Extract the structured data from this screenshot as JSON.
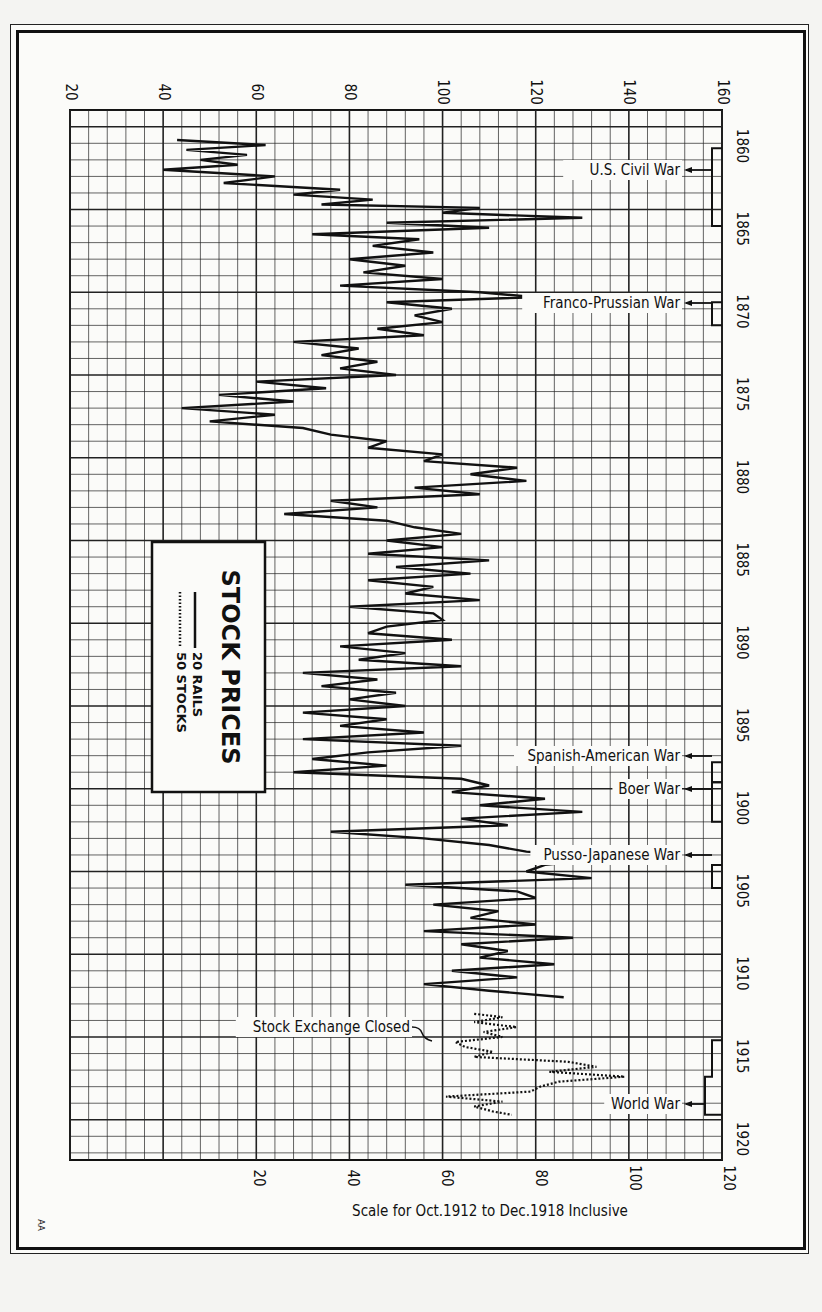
{
  "chart_data": {
    "type": "line",
    "title": "STOCK PRICES",
    "orientation": "rotated-90 (years run top-to-bottom, price runs left-to-right)",
    "legend": [
      {
        "label": "20 RAILS",
        "style": "solid"
      },
      {
        "label": "50 STOCKS",
        "style": "dotted"
      }
    ],
    "legend_position": "left-center box",
    "grid": true,
    "year_axis": {
      "ticks": [
        "1860",
        "1865",
        "1870",
        "1875",
        "1880",
        "1885",
        "1890",
        "1895",
        "1900",
        "1905",
        "1910",
        "1915",
        "1920"
      ],
      "range": [
        1860,
        1920
      ]
    },
    "price_axis_top": {
      "label": "",
      "ticks": [
        "20",
        "40",
        "60",
        "80",
        "100",
        "120",
        "140",
        "160"
      ],
      "range": [
        20,
        160
      ]
    },
    "price_axis_bottom": {
      "label": "Scale for Oct.1912 to Dec.1918 Inclusive",
      "ticks": [
        "20",
        "40",
        "60",
        "80",
        "100",
        "120"
      ],
      "range": [
        0,
        120
      ]
    },
    "annotations": [
      {
        "text": "U.S. Civil War",
        "years": [
          1861,
          1865
        ]
      },
      {
        "text": "Franco-Prussian War",
        "years": [
          1870,
          1871
        ]
      },
      {
        "text": "Spanish-American War",
        "years": [
          1898,
          1898
        ]
      },
      {
        "text": "Boer War",
        "years": [
          1899,
          1902
        ]
      },
      {
        "text": "Pusso-Japanese War",
        "years": [
          1904,
          1905
        ]
      },
      {
        "text": "Stock Exchange Closed",
        "years": [
          1914,
          1914
        ]
      },
      {
        "text": "World War",
        "years": [
          1914,
          1918
        ]
      }
    ],
    "series": [
      {
        "name": "20 RAILS",
        "style": "solid",
        "x_year": [
          1860.0,
          1860.3,
          1860.6,
          1860.9,
          1861.2,
          1861.5,
          1861.8,
          1862.2,
          1862.6,
          1863.0,
          1863.3,
          1863.6,
          1863.9,
          1864.1,
          1864.4,
          1864.7,
          1865.0,
          1865.3,
          1865.7,
          1866.0,
          1866.4,
          1866.8,
          1867.2,
          1867.6,
          1868.0,
          1868.4,
          1868.8,
          1869.2,
          1869.5,
          1869.8,
          1870.2,
          1870.6,
          1871.0,
          1871.4,
          1871.8,
          1872.2,
          1872.6,
          1873.0,
          1873.4,
          1873.8,
          1874.2,
          1874.6,
          1875.0,
          1875.4,
          1875.8,
          1876.2,
          1876.6,
          1877.0,
          1877.4,
          1877.8,
          1878.2,
          1878.6,
          1879.0,
          1879.4,
          1879.8,
          1880.2,
          1880.6,
          1881.0,
          1881.4,
          1881.8,
          1882.2,
          1882.6,
          1883.0,
          1883.4,
          1883.8,
          1884.2,
          1884.6,
          1885.0,
          1885.4,
          1885.8,
          1886.2,
          1886.6,
          1887.0,
          1887.4,
          1887.8,
          1888.2,
          1888.6,
          1889.0,
          1889.4,
          1889.8,
          1890.2,
          1890.6,
          1891.0,
          1891.4,
          1891.8,
          1892.2,
          1892.6,
          1893.0,
          1893.4,
          1893.8,
          1894.2,
          1894.6,
          1895.0,
          1895.4,
          1895.8,
          1896.2,
          1896.6,
          1897.0,
          1897.4,
          1897.8,
          1898.2,
          1898.6,
          1899.0,
          1899.4,
          1899.8,
          1900.2,
          1900.6,
          1901.0,
          1901.4,
          1901.8,
          1902.2,
          1902.6,
          1903.0,
          1903.4,
          1903.8,
          1904.2,
          1904.6,
          1905.0,
          1905.4,
          1905.8,
          1906.2,
          1906.6,
          1907.0,
          1907.4,
          1907.8,
          1908.2,
          1908.6,
          1909.0,
          1909.4,
          1909.8,
          1910.2,
          1910.6,
          1911.0,
          1911.4,
          1911.8,
          1912.2,
          1912.6
        ],
        "values": [
          43,
          62,
          45,
          58,
          48,
          56,
          40,
          64,
          53,
          78,
          68,
          85,
          74,
          108,
          100,
          130,
          88,
          110,
          72,
          95,
          85,
          98,
          80,
          92,
          83,
          100,
          78,
          108,
          120,
          88,
          102,
          94,
          100,
          86,
          96,
          68,
          82,
          74,
          86,
          78,
          90,
          60,
          75,
          52,
          68,
          44,
          64,
          50,
          70,
          76,
          88,
          84,
          100,
          96,
          116,
          106,
          118,
          94,
          108,
          76,
          86,
          66,
          88,
          94,
          104,
          88,
          100,
          84,
          110,
          90,
          106,
          84,
          98,
          92,
          108,
          80,
          98,
          100,
          88,
          84,
          102,
          78,
          92,
          82,
          104,
          70,
          86,
          74,
          90,
          80,
          92,
          70,
          88,
          78,
          96,
          70,
          104,
          84,
          72,
          88,
          68,
          104,
          110,
          102,
          122,
          108,
          130,
          104,
          114,
          76,
          96,
          110,
          118,
          136,
          122,
          118,
          132,
          92,
          116,
          120,
          98,
          112,
          106,
          120,
          96,
          128,
          104,
          114,
          108,
          124,
          102,
          116,
          96,
          110,
          126
        ]
      },
      {
        "name": "50 STOCKS",
        "style": "dotted",
        "scale": "bottom",
        "x_year": [
          1912.8,
          1913.0,
          1913.3,
          1913.6,
          1913.9,
          1914.2,
          1914.5,
          1914.8,
          1915.1,
          1915.4,
          1915.7,
          1916.0,
          1916.3,
          1916.6,
          1916.9,
          1917.2,
          1917.5,
          1917.8,
          1918.1,
          1918.4,
          1918.7,
          1918.9
        ],
        "values": [
          66,
          72,
          66,
          75,
          68,
          72,
          62,
          64,
          70,
          66,
          86,
          92,
          82,
          98,
          84,
          80,
          78,
          60,
          72,
          66,
          70,
          74
        ]
      }
    ]
  },
  "legend_box": {
    "title": "STOCK PRICES",
    "items": [
      "20 RAILS",
      "50 STOCKS"
    ]
  },
  "axis_labels": {
    "top_ticks": [
      "20",
      "40",
      "60",
      "80",
      "100",
      "120",
      "140",
      "160"
    ],
    "bottom_ticks": [
      "20",
      "40",
      "60",
      "80",
      "100",
      "120"
    ],
    "year_ticks": [
      "1860",
      "1865",
      "1870",
      "1875",
      "1880",
      "1885",
      "1890",
      "1895",
      "1900",
      "1905",
      "1910",
      "1915",
      "1920"
    ],
    "bottom_caption": "Scale for Oct.1912 to Dec.1918 Inclusive"
  },
  "war_labels": {
    "civil": "U.S. Civil War",
    "franco": "Franco-Prussian War",
    "spanish": "Spanish-American War",
    "boer": "Boer War",
    "russo": "Pusso-Japanese War",
    "exchange": "Stock Exchange Closed",
    "world": "World War"
  },
  "corner_mark": "AA"
}
